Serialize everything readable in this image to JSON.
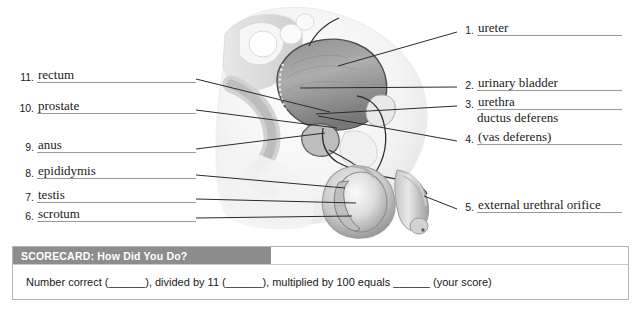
{
  "figure": {
    "name": "male-reproductive-system-sagittal-section",
    "palette": {
      "line": "#2b2b2b",
      "underline": "#9a9a9a",
      "tissue_light": "#f2f2f2",
      "tissue_mid": "#cfcfcf",
      "tissue_dark": "#9a9a9a",
      "organ_dark": "#6f6f6f"
    }
  },
  "labels_left": [
    {
      "number": "11.",
      "term": "rectum"
    },
    {
      "number": "10.",
      "term": "prostate"
    },
    {
      "number": "9.",
      "term": "anus"
    },
    {
      "number": "8.",
      "term": "epididymis"
    },
    {
      "number": "7.",
      "term": "testis"
    },
    {
      "number": "6.",
      "term": "scrotum"
    }
  ],
  "labels_right": [
    {
      "number": "1.",
      "term": "ureter"
    },
    {
      "number": "2.",
      "term": "urinary bladder"
    },
    {
      "number": "3.",
      "term": "urethra"
    },
    {
      "number": "4.",
      "term": "(vas deferens)"
    },
    {
      "number": "5.",
      "term": "external urethral orifice"
    }
  ],
  "labels_right_extra": {
    "ductus_deferens": "ductus deferens"
  },
  "scorecard": {
    "title": "SCORECARD: How Did You Do?",
    "body": "Number correct (______), divided by 11 (______), multiplied by 100 equals ______ (your score)",
    "header_color": "#8d8d8d",
    "border_color": "#b5b5b5"
  }
}
